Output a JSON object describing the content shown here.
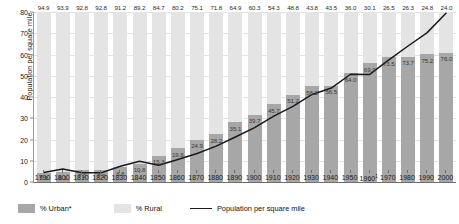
{
  "chart": {
    "ylabel": "Population per square mile",
    "yticks": [
      0,
      10,
      20,
      30,
      40,
      50,
      60,
      70,
      80
    ],
    "ylim": [
      0,
      80
    ],
    "footnote_marker": "1"
  },
  "legend": {
    "urban_label": "% Urban*",
    "rural_label": "% Rural",
    "line_label": "Population per square mile",
    "urban_color": "#a7a7a7",
    "rural_color": "#e4e4e4",
    "line_color": "#1a1a1a"
  },
  "chart_data": {
    "type": "bar",
    "title": "",
    "xlabel": "",
    "ylabel": "Population per square mile",
    "ylim": [
      0,
      80
    ],
    "grid": true,
    "legend_position": "bottom-left",
    "categories": [
      "1790",
      "1800",
      "1810",
      "1820",
      "1830",
      "1840",
      "1850",
      "1860",
      "1870",
      "1880",
      "1890",
      "1900",
      "1910",
      "1920",
      "1930",
      "1940",
      "1950",
      "1960",
      "1970",
      "1980",
      "1990",
      "2000"
    ],
    "series": [
      {
        "name": "% Urban*",
        "type": "bar-stacked-bottom",
        "values": [
          5.1,
          6.1,
          7.2,
          7.2,
          8.8,
          10.8,
          15.3,
          19.8,
          24.9,
          28.2,
          35.1,
          39.7,
          45.7,
          51.2,
          56.2,
          56.5,
          64.0,
          69.9,
          73.5,
          73.7,
          75.2,
          76.0
        ]
      },
      {
        "name": "% Rural",
        "type": "bar-stacked-top",
        "values": [
          94.9,
          93.9,
          92.8,
          92.8,
          91.2,
          89.2,
          84.7,
          80.2,
          75.1,
          71.8,
          64.9,
          60.3,
          54.3,
          48.8,
          43.8,
          43.5,
          36.0,
          30.1,
          26.5,
          26.3,
          24.8,
          24.0
        ]
      },
      {
        "name": "Population per square mile",
        "type": "line",
        "values": [
          4.5,
          6.1,
          4.3,
          4.3,
          7.4,
          9.8,
          7.9,
          10.6,
          13.4,
          16.9,
          21.2,
          25.6,
          31.0,
          35.6,
          41.2,
          44.2,
          50.7,
          50.6,
          57.5,
          64.0,
          70.3,
          79.6
        ]
      }
    ]
  }
}
